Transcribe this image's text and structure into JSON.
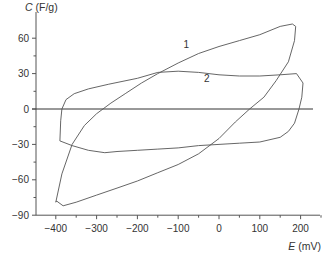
{
  "chart_data": {
    "type": "line",
    "title": "",
    "xlabel": "E (mV)",
    "ylabel": "C (F/g)",
    "xlabel_var": "E",
    "xlabel_unit": "(mV)",
    "ylabel_var": "C",
    "ylabel_unit": "(F/g)",
    "xlim": [
      -450,
      250
    ],
    "ylim": [
      -90,
      75
    ],
    "x_ticks": [
      -400,
      -300,
      -200,
      -100,
      0,
      100,
      200
    ],
    "y_ticks": [
      60,
      30,
      0,
      -30,
      -60,
      -90
    ],
    "x_tick_labels": [
      "−400",
      "−300",
      "−200",
      "−100",
      "0",
      "100",
      "200"
    ],
    "y_tick_labels": [
      "60",
      "30",
      "0",
      "−30",
      "−60",
      "−90"
    ],
    "grid": false,
    "zero_line": true,
    "legend": "inline labels",
    "series": [
      {
        "name": "1",
        "closed": true,
        "points": [
          [
            -400,
            -79
          ],
          [
            -385,
            -55
          ],
          [
            -360,
            -30
          ],
          [
            -330,
            -14
          ],
          [
            -300,
            -4
          ],
          [
            -265,
            5
          ],
          [
            -230,
            13
          ],
          [
            -190,
            22
          ],
          [
            -150,
            30
          ],
          [
            -100,
            39
          ],
          [
            -50,
            47
          ],
          [
            0,
            53
          ],
          [
            50,
            58
          ],
          [
            100,
            63
          ],
          [
            150,
            70
          ],
          [
            180,
            72
          ],
          [
            188,
            70
          ],
          [
            185,
            58
          ],
          [
            170,
            40
          ],
          [
            140,
            24
          ],
          [
            110,
            10
          ],
          [
            75,
            0
          ],
          [
            40,
            -11
          ],
          [
            0,
            -25
          ],
          [
            -50,
            -38
          ],
          [
            -100,
            -47
          ],
          [
            -150,
            -54
          ],
          [
            -200,
            -61
          ],
          [
            -250,
            -67
          ],
          [
            -300,
            -73
          ],
          [
            -350,
            -79
          ],
          [
            -382,
            -82
          ],
          [
            -398,
            -78
          ]
        ]
      },
      {
        "name": "2",
        "closed": true,
        "points": [
          [
            -390,
            -27
          ],
          [
            -388,
            -10
          ],
          [
            -385,
            0
          ],
          [
            -375,
            8
          ],
          [
            -355,
            13
          ],
          [
            -320,
            17
          ],
          [
            -270,
            21
          ],
          [
            -200,
            26
          ],
          [
            -150,
            31
          ],
          [
            -100,
            32
          ],
          [
            -50,
            31
          ],
          [
            0,
            29
          ],
          [
            50,
            28
          ],
          [
            100,
            28
          ],
          [
            150,
            29
          ],
          [
            190,
            30
          ],
          [
            206,
            22
          ],
          [
            203,
            10
          ],
          [
            196,
            0
          ],
          [
            185,
            -12
          ],
          [
            170,
            -19
          ],
          [
            150,
            -24
          ],
          [
            100,
            -28
          ],
          [
            50,
            -29
          ],
          [
            0,
            -30
          ],
          [
            -50,
            -31
          ],
          [
            -100,
            -33
          ],
          [
            -150,
            -34
          ],
          [
            -200,
            -35
          ],
          [
            -250,
            -36
          ],
          [
            -280,
            -37
          ],
          [
            -320,
            -35
          ],
          [
            -360,
            -31
          ],
          [
            -390,
            -27
          ]
        ]
      }
    ],
    "annotations": [
      {
        "text": "1",
        "x": -80,
        "y": 52
      },
      {
        "text": "2",
        "x": -30,
        "y": 23
      }
    ]
  },
  "labels": {
    "curve1": "1",
    "curve2": "2"
  }
}
